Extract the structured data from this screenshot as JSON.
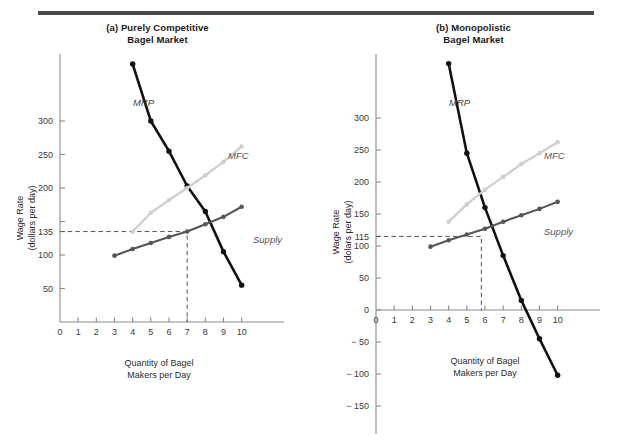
{
  "figure": {
    "rule_color": "#4a4a4a",
    "background": "#ffffff"
  },
  "panels": [
    {
      "id": "panel-a",
      "title_line1": "(a) Purely Competitive",
      "title_line2": "Bagel Market",
      "ylabel_line1": "Wage Rate",
      "ylabel_line2": "(dollars per day)",
      "xlabel_line1": "Quantity of Bagel",
      "xlabel_line2": "Makers per Day",
      "chart_data": {
        "type": "line",
        "title": "(a) Purely Competitive Bagel Market",
        "xlabel": "Quantity of Bagel Makers per Day",
        "ylabel": "Wage Rate (dollars per day)",
        "xlim": [
          0,
          10.9
        ],
        "ylim": [
          0,
          400
        ],
        "xticks": [
          0,
          1,
          2,
          3,
          4,
          5,
          6,
          7,
          8,
          9,
          10
        ],
        "xtick_labels": [
          "0",
          "1",
          "2",
          "3",
          "4",
          "5",
          "6",
          "7",
          "8",
          "9",
          "10"
        ],
        "yticks": [
          50,
          100,
          135,
          150,
          200,
          250,
          300
        ],
        "ytick_labels": [
          "50",
          "100",
          "135",
          "",
          "200",
          "250",
          "300"
        ],
        "grid": false,
        "legend": "inline-labels",
        "equilibrium": {
          "quantity": 7,
          "wage": 135,
          "label_x": "7",
          "label_y": "135"
        },
        "series": [
          {
            "name": "MRP",
            "color": "#111111",
            "x": [
              4,
              5,
              6,
              7,
              8,
              9,
              10
            ],
            "values": [
              385,
              300,
              255,
              203,
              165,
              105,
              55
            ]
          },
          {
            "name": "MFC",
            "color": "#cfcfcf",
            "x": [
              4,
              5,
              6,
              7,
              8,
              9,
              10
            ],
            "values": [
              135,
              163,
              182,
              200,
              219,
              239,
              262
            ]
          },
          {
            "name": "Supply",
            "color": "#565656",
            "x": [
              3,
              4,
              5,
              6,
              7,
              8,
              9,
              10
            ],
            "values": [
              99,
              109,
              118,
              127,
              135,
              146,
              157,
              172
            ]
          }
        ]
      }
    },
    {
      "id": "panel-b",
      "title_line1": "(b) Monopolistic",
      "title_line2": "Bagel Market",
      "ylabel_line1": "Wage Rate",
      "ylabel_line2": "(dolars per day)",
      "xlabel_line1": "Quantity of Bagel",
      "xlabel_line2": "Makers per Day",
      "chart_data": {
        "type": "line",
        "title": "(b) Monopolistic Bagel Market",
        "xlabel": "Quantity of Bagel Makers per Day",
        "ylabel": "Wage Rate (dolars per day)",
        "xlim": [
          0,
          10.9
        ],
        "ylim": [
          -175,
          400
        ],
        "xticks": [
          0,
          1,
          2,
          3,
          4,
          5,
          6,
          7,
          8,
          9,
          10
        ],
        "xtick_labels": [
          "0",
          "1",
          "2",
          "3",
          "4",
          "5",
          "6",
          "7",
          "8",
          "9",
          "10"
        ],
        "yticks": [
          -150,
          -100,
          -50,
          0,
          50,
          100,
          115,
          150,
          200,
          250,
          300
        ],
        "ytick_labels": [
          "− 150",
          "− 100",
          "− 50",
          "0",
          "50",
          "100",
          "115",
          "150",
          "200",
          "250",
          "300"
        ],
        "grid": false,
        "legend": "inline-labels",
        "equilibrium": {
          "quantity": 5.8,
          "wage": 115,
          "label_x": "",
          "label_y": "115"
        },
        "series": [
          {
            "name": "MRP",
            "color": "#111111",
            "x": [
              4,
              5,
              6,
              7,
              8,
              9,
              10
            ],
            "values": [
              385,
              245,
              160,
              85,
              15,
              -45,
              -102
            ]
          },
          {
            "name": "MFC",
            "color": "#cfcfcf",
            "x": [
              4,
              5,
              6,
              7,
              8,
              9,
              10
            ],
            "values": [
              138,
              165,
              188,
              208,
              228,
              245,
              262
            ]
          },
          {
            "name": "Supply",
            "color": "#565656",
            "x": [
              3,
              4,
              5,
              6,
              7,
              8,
              9,
              10
            ],
            "values": [
              99,
              109,
              118,
              127,
              138,
              148,
              158,
              169
            ]
          }
        ]
      }
    }
  ]
}
